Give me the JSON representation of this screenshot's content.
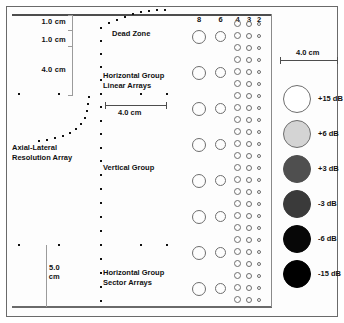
{
  "figure": {
    "background": "#ffffff",
    "frame_color": "#6a6a6a"
  },
  "depth_scale": {
    "labels": [
      {
        "text": "1.0 cm",
        "x": 24,
        "y": 17
      },
      {
        "text": "1.0 cm",
        "x": 24,
        "y": 35
      },
      {
        "text": "4.0 cm",
        "x": 24,
        "y": 65
      },
      {
        "text": "5.0",
        "x": 18,
        "y": 263
      },
      {
        "text": "cm",
        "x": 18,
        "y": 272
      }
    ],
    "ticks_upper": [
      15,
      30,
      46,
      95
    ],
    "upper_line": {
      "x": 72,
      "y": 15,
      "height": 80
    },
    "lower_line": {
      "x": 46,
      "y": 245,
      "height": 62
    }
  },
  "annotations": [
    {
      "name": "dead-zone",
      "lines": [
        "Dead Zone"
      ],
      "x": 112,
      "y": 29
    },
    {
      "name": "horizontal-group-linear-arrays",
      "lines": [
        "Horizontal Group",
        "Linear Arrays"
      ],
      "x": 103,
      "y": 71
    },
    {
      "name": "axial-lateral-resolution-array",
      "lines": [
        "Axial-Lateral",
        "Resolution Array"
      ],
      "x": 12,
      "y": 143
    },
    {
      "name": "vertical-group",
      "lines": [
        "Vertical Group"
      ],
      "x": 103,
      "y": 163
    },
    {
      "name": "horizontal-group-sector-arrays",
      "lines": [
        "Horizontal Group",
        "Sector Arrays"
      ],
      "x": 103,
      "y": 268
    }
  ],
  "scale_bars": [
    {
      "name": "scale-bar-center",
      "label": "4.0 cm",
      "x": 105,
      "y": 105,
      "width": 62,
      "label_x": 118,
      "label_y": 108
    },
    {
      "name": "scale-bar-top-right",
      "label": "4.0 cm",
      "x": 280,
      "y": 60,
      "width": 58,
      "label_x": 296,
      "label_y": 48
    }
  ],
  "pin_targets": {
    "dead_zone_arc": [
      [
        100,
        27
      ],
      [
        108,
        22
      ],
      [
        116,
        19
      ],
      [
        124,
        16
      ],
      [
        132,
        13
      ],
      [
        140,
        11
      ],
      [
        148,
        10
      ],
      [
        156,
        9
      ],
      [
        164,
        9
      ]
    ],
    "vertical_column": [
      [
        100,
        27
      ],
      [
        100,
        40
      ],
      [
        100,
        53
      ],
      [
        100,
        66
      ],
      [
        100,
        79
      ],
      [
        100,
        93
      ],
      [
        100,
        106
      ],
      [
        100,
        120
      ],
      [
        100,
        133
      ],
      [
        100,
        147
      ],
      [
        100,
        160
      ],
      [
        100,
        174
      ],
      [
        100,
        188
      ],
      [
        100,
        202
      ],
      [
        100,
        216
      ],
      [
        100,
        230
      ],
      [
        100,
        244
      ],
      [
        100,
        258
      ],
      [
        100,
        272
      ],
      [
        100,
        286
      ],
      [
        100,
        300
      ]
    ],
    "horizontal_linear_row": [
      [
        18,
        93
      ],
      [
        58,
        93
      ],
      [
        100,
        93
      ],
      [
        140,
        93
      ],
      [
        166,
        93
      ]
    ],
    "horizontal_sector_row": [
      [
        18,
        244
      ],
      [
        58,
        244
      ],
      [
        100,
        244
      ],
      [
        140,
        244
      ],
      [
        166,
        244
      ]
    ],
    "axial_lateral_arc": [
      [
        38,
        140
      ],
      [
        46,
        139
      ],
      [
        54,
        137
      ],
      [
        62,
        135
      ],
      [
        69,
        132
      ],
      [
        75,
        128
      ],
      [
        80,
        123
      ],
      [
        84,
        117
      ],
      [
        86,
        110
      ],
      [
        87,
        103
      ],
      [
        88,
        96
      ]
    ]
  },
  "target_columns": {
    "headers": [
      "8",
      "6",
      "4",
      "3",
      "2"
    ],
    "header_y": 15,
    "columns": [
      {
        "label": "8",
        "x": 192,
        "diameter": 14,
        "spacing": 36,
        "first_y": 30,
        "count": 8
      },
      {
        "label": "6",
        "x": 215,
        "diameter": 11,
        "spacing": 36,
        "first_y": 31,
        "count": 8
      },
      {
        "label": "4",
        "x": 234,
        "diameter": 7,
        "spacing": 12,
        "first_y": 20,
        "count": 24
      },
      {
        "label": "3",
        "x": 246,
        "diameter": 6,
        "spacing": 12,
        "first_y": 21,
        "count": 24
      },
      {
        "label": "2",
        "x": 257,
        "diameter": 4,
        "spacing": 12,
        "first_y": 22,
        "count": 24
      }
    ]
  },
  "legend": {
    "x": 283,
    "diameter": 28,
    "items": [
      {
        "label": "+15 dB",
        "fill": "#ffffff",
        "border": "#6e6e6e",
        "y": 85
      },
      {
        "label": "+6 dB",
        "fill": "#d4d4d4",
        "border": "#6e6e6e",
        "y": 120
      },
      {
        "label": "+3 dB",
        "fill": "#4f4f4f",
        "border": "#4f4f4f",
        "y": 155
      },
      {
        "label": "-3 dB",
        "fill": "#3a3a3a",
        "border": "#3a3a3a",
        "y": 190
      },
      {
        "label": "-6 dB",
        "fill": "#070707",
        "border": "#070707",
        "y": 225
      },
      {
        "label": "-15 dB",
        "fill": "#000000",
        "border": "#000000",
        "y": 260
      }
    ],
    "label_x": 318
  }
}
